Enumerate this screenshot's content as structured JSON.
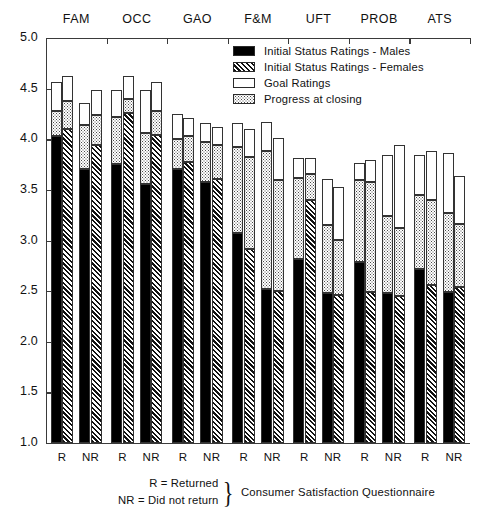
{
  "chart_data": {
    "type": "bar",
    "title": "",
    "subtitle": "",
    "xlabel": "Consumer Satisfaction Questionnaire",
    "ylabel": "",
    "ylim": [
      1.0,
      5.0
    ],
    "ytick_labels": [
      "5.0",
      "4.5",
      "4.0",
      "3.5",
      "3.0",
      "2.5",
      "2.0",
      "1.5",
      "1.0"
    ],
    "ytick_values": [
      5.0,
      4.5,
      4.0,
      3.5,
      3.0,
      2.5,
      2.0,
      1.5,
      1.0
    ],
    "grid": false,
    "stacked": true,
    "legend_position": "top-right",
    "categories": [
      "FAM",
      "OCC",
      "GAO",
      "F&M",
      "UFT",
      "PROB",
      "ATS"
    ],
    "subgroups": [
      "R",
      "NR"
    ],
    "series": [
      {
        "name": "Initial Status Ratings - Males",
        "key": "males",
        "fill": "solid-black"
      },
      {
        "name": "Initial Status Ratings - Females",
        "key": "females",
        "fill": "diagonal-hatch"
      },
      {
        "name": "Goal Ratings",
        "key": "goal",
        "fill": "white"
      },
      {
        "name": "Progress at closing",
        "key": "progress",
        "fill": "dotted"
      }
    ],
    "bars": [
      {
        "group": "FAM",
        "subgroup": "R",
        "sex": "males",
        "initial": 4.03,
        "progress": 4.28,
        "goal": 4.57
      },
      {
        "group": "FAM",
        "subgroup": "R",
        "sex": "females",
        "initial": 4.1,
        "progress": 4.38,
        "goal": 4.62
      },
      {
        "group": "FAM",
        "subgroup": "NR",
        "sex": "males",
        "initial": 3.71,
        "progress": 4.14,
        "goal": 4.36
      },
      {
        "group": "FAM",
        "subgroup": "NR",
        "sex": "females",
        "initial": 3.94,
        "progress": 4.24,
        "goal": 4.49
      },
      {
        "group": "OCC",
        "subgroup": "R",
        "sex": "males",
        "initial": 3.76,
        "progress": 4.22,
        "goal": 4.49
      },
      {
        "group": "OCC",
        "subgroup": "R",
        "sex": "females",
        "initial": 4.26,
        "progress": 4.4,
        "goal": 4.62
      },
      {
        "group": "OCC",
        "subgroup": "NR",
        "sex": "males",
        "initial": 3.56,
        "progress": 4.06,
        "goal": 4.49
      },
      {
        "group": "OCC",
        "subgroup": "NR",
        "sex": "females",
        "initial": 4.04,
        "progress": 4.28,
        "goal": 4.57
      },
      {
        "group": "GAO",
        "subgroup": "R",
        "sex": "males",
        "initial": 3.71,
        "progress": 4.0,
        "goal": 4.25
      },
      {
        "group": "GAO",
        "subgroup": "R",
        "sex": "females",
        "initial": 3.78,
        "progress": 4.03,
        "goal": 4.21
      },
      {
        "group": "GAO",
        "subgroup": "NR",
        "sex": "males",
        "initial": 3.58,
        "progress": 3.97,
        "goal": 4.16
      },
      {
        "group": "GAO",
        "subgroup": "NR",
        "sex": "females",
        "initial": 3.61,
        "progress": 3.94,
        "goal": 4.12
      },
      {
        "group": "F&M",
        "subgroup": "R",
        "sex": "males",
        "initial": 3.07,
        "progress": 3.92,
        "goal": 4.16
      },
      {
        "group": "F&M",
        "subgroup": "R",
        "sex": "females",
        "initial": 2.92,
        "progress": 3.82,
        "goal": 4.1
      },
      {
        "group": "F&M",
        "subgroup": "NR",
        "sex": "males",
        "initial": 2.52,
        "progress": 3.88,
        "goal": 4.17
      },
      {
        "group": "F&M",
        "subgroup": "NR",
        "sex": "females",
        "initial": 2.5,
        "progress": 3.6,
        "goal": 4.01
      },
      {
        "group": "UFT",
        "subgroup": "R",
        "sex": "males",
        "initial": 2.82,
        "progress": 3.62,
        "goal": 3.81
      },
      {
        "group": "UFT",
        "subgroup": "R",
        "sex": "females",
        "initial": 3.4,
        "progress": 3.66,
        "goal": 3.81
      },
      {
        "group": "UFT",
        "subgroup": "NR",
        "sex": "males",
        "initial": 2.48,
        "progress": 3.15,
        "goal": 3.61
      },
      {
        "group": "UFT",
        "subgroup": "NR",
        "sex": "females",
        "initial": 2.46,
        "progress": 3.0,
        "goal": 3.53
      },
      {
        "group": "PROB",
        "subgroup": "R",
        "sex": "males",
        "initial": 2.79,
        "progress": 3.6,
        "goal": 3.77
      },
      {
        "group": "PROB",
        "subgroup": "R",
        "sex": "females",
        "initial": 2.49,
        "progress": 3.58,
        "goal": 3.8
      },
      {
        "group": "PROB",
        "subgroup": "NR",
        "sex": "males",
        "initial": 2.48,
        "progress": 3.24,
        "goal": 3.84
      },
      {
        "group": "PROB",
        "subgroup": "NR",
        "sex": "females",
        "initial": 2.45,
        "progress": 3.12,
        "goal": 3.94
      },
      {
        "group": "ATS",
        "subgroup": "R",
        "sex": "males",
        "initial": 2.72,
        "progress": 3.45,
        "goal": 3.84
      },
      {
        "group": "ATS",
        "subgroup": "R",
        "sex": "females",
        "initial": 2.56,
        "progress": 3.4,
        "goal": 3.88
      },
      {
        "group": "ATS",
        "subgroup": "NR",
        "sex": "males",
        "initial": 2.49,
        "progress": 3.27,
        "goal": 3.86
      },
      {
        "group": "ATS",
        "subgroup": "NR",
        "sex": "females",
        "initial": 2.54,
        "progress": 3.16,
        "goal": 3.64
      }
    ]
  },
  "legend": {
    "items": [
      {
        "label": "Initial Status Ratings - Males",
        "swatch": "males"
      },
      {
        "label": "Initial Status Ratings - Females",
        "swatch": "females"
      },
      {
        "label": "Goal Ratings",
        "swatch": "goal"
      },
      {
        "label": "Progress at closing",
        "swatch": "progress"
      }
    ]
  },
  "axis": {
    "subgroup_labels": [
      "R",
      "NR"
    ]
  },
  "footnote": {
    "line1": "R = Returned",
    "line2": "NR = Did not return",
    "brace": "}",
    "caption": "Consumer Satisfaction Questionnaire"
  }
}
